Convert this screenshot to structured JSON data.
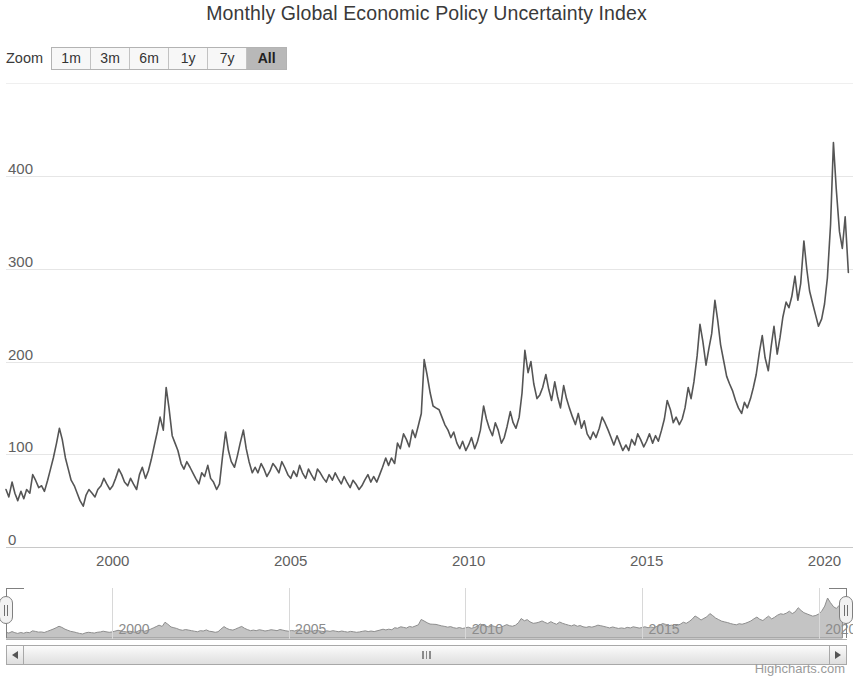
{
  "title": "Monthly Global Economic Policy Uncertainty Index",
  "range_selector": {
    "label": "Zoom",
    "buttons": [
      {
        "label": "1m",
        "selected": false
      },
      {
        "label": "3m",
        "selected": false
      },
      {
        "label": "6m",
        "selected": false
      },
      {
        "label": "1y",
        "selected": false
      },
      {
        "label": "7y",
        "selected": false
      },
      {
        "label": "All",
        "selected": true
      }
    ]
  },
  "credits": "Highcharts.com",
  "colors": {
    "line": "#555555",
    "gridline": "#e6e6e6",
    "nav_fill": "#b0b0b0",
    "nav_line": "#8e8e8e",
    "text": "#606060",
    "title": "#3a3a3a",
    "button_selected_bg": "#b8b8b8"
  },
  "scrollbar": {
    "left_arrow": "scroll-left-arrow-icon",
    "right_arrow": "scroll-right-arrow-icon"
  },
  "chart_data": {
    "type": "line",
    "title": "Monthly Global Economic Policy Uncertainty Index",
    "xlabel": "",
    "ylabel": "",
    "grid": true,
    "legend": false,
    "xlim": [
      1997.0,
      2020.8
    ],
    "ylim": [
      0,
      460
    ],
    "yticks": [
      0,
      100,
      200,
      300,
      400
    ],
    "xticks": [
      2000,
      2005,
      2010,
      2015,
      2020
    ],
    "x_tick_labels": [
      "2000",
      "2005",
      "2010",
      "2015",
      "2020"
    ],
    "y_tick_labels": [
      "0",
      "100",
      "200",
      "300",
      "400"
    ],
    "navigator": {
      "xticks": [
        2000,
        2005,
        2010,
        2015,
        2020
      ],
      "x_tick_labels": [
        "2000",
        "2005",
        "2010",
        "2015",
        "2020"
      ],
      "range_start": 1997.0,
      "range_end": 2020.8
    },
    "series": [
      {
        "name": "Global Economic Policy Uncertainty Index",
        "x": [
          1997.0,
          1997.08,
          1997.17,
          1997.25,
          1997.33,
          1997.42,
          1997.5,
          1997.58,
          1997.67,
          1997.75,
          1997.83,
          1997.92,
          1998.0,
          1998.08,
          1998.17,
          1998.25,
          1998.33,
          1998.42,
          1998.5,
          1998.58,
          1998.67,
          1998.75,
          1998.83,
          1998.92,
          1999.0,
          1999.08,
          1999.17,
          1999.25,
          1999.33,
          1999.42,
          1999.5,
          1999.58,
          1999.67,
          1999.75,
          1999.83,
          1999.92,
          2000.0,
          2000.08,
          2000.17,
          2000.25,
          2000.33,
          2000.42,
          2000.5,
          2000.58,
          2000.67,
          2000.75,
          2000.83,
          2000.92,
          2001.0,
          2001.08,
          2001.17,
          2001.25,
          2001.33,
          2001.42,
          2001.5,
          2001.58,
          2001.67,
          2001.75,
          2001.83,
          2001.92,
          2002.0,
          2002.08,
          2002.17,
          2002.25,
          2002.33,
          2002.42,
          2002.5,
          2002.58,
          2002.67,
          2002.75,
          2002.83,
          2002.92,
          2003.0,
          2003.08,
          2003.17,
          2003.25,
          2003.33,
          2003.42,
          2003.5,
          2003.58,
          2003.67,
          2003.75,
          2003.83,
          2003.92,
          2004.0,
          2004.08,
          2004.17,
          2004.25,
          2004.33,
          2004.42,
          2004.5,
          2004.58,
          2004.67,
          2004.75,
          2004.83,
          2004.92,
          2005.0,
          2005.08,
          2005.17,
          2005.25,
          2005.33,
          2005.42,
          2005.5,
          2005.58,
          2005.67,
          2005.75,
          2005.83,
          2005.92,
          2006.0,
          2006.08,
          2006.17,
          2006.25,
          2006.33,
          2006.42,
          2006.5,
          2006.58,
          2006.67,
          2006.75,
          2006.83,
          2006.92,
          2007.0,
          2007.08,
          2007.17,
          2007.25,
          2007.33,
          2007.42,
          2007.5,
          2007.58,
          2007.67,
          2007.75,
          2007.83,
          2007.92,
          2008.0,
          2008.08,
          2008.17,
          2008.25,
          2008.33,
          2008.42,
          2008.5,
          2008.58,
          2008.67,
          2008.75,
          2008.83,
          2008.92,
          2009.0,
          2009.08,
          2009.17,
          2009.25,
          2009.33,
          2009.42,
          2009.5,
          2009.58,
          2009.67,
          2009.75,
          2009.83,
          2009.92,
          2010.0,
          2010.08,
          2010.17,
          2010.25,
          2010.33,
          2010.42,
          2010.5,
          2010.58,
          2010.67,
          2010.75,
          2010.83,
          2010.92,
          2011.0,
          2011.08,
          2011.17,
          2011.25,
          2011.33,
          2011.42,
          2011.5,
          2011.58,
          2011.67,
          2011.75,
          2011.83,
          2011.92,
          2012.0,
          2012.08,
          2012.17,
          2012.25,
          2012.33,
          2012.42,
          2012.5,
          2012.58,
          2012.67,
          2012.75,
          2012.83,
          2012.92,
          2013.0,
          2013.08,
          2013.17,
          2013.25,
          2013.33,
          2013.42,
          2013.5,
          2013.58,
          2013.67,
          2013.75,
          2013.83,
          2013.92,
          2014.0,
          2014.08,
          2014.17,
          2014.25,
          2014.33,
          2014.42,
          2014.5,
          2014.58,
          2014.67,
          2014.75,
          2014.83,
          2014.92,
          2015.0,
          2015.08,
          2015.17,
          2015.25,
          2015.33,
          2015.42,
          2015.5,
          2015.58,
          2015.67,
          2015.75,
          2015.83,
          2015.92,
          2016.0,
          2016.08,
          2016.17,
          2016.25,
          2016.33,
          2016.42,
          2016.5,
          2016.58,
          2016.67,
          2016.75,
          2016.83,
          2016.92,
          2017.0,
          2017.08,
          2017.17,
          2017.25,
          2017.33,
          2017.42,
          2017.5,
          2017.58,
          2017.67,
          2017.75,
          2017.83,
          2017.92,
          2018.0,
          2018.08,
          2018.17,
          2018.25,
          2018.33,
          2018.42,
          2018.5,
          2018.58,
          2018.67,
          2018.75,
          2018.83,
          2018.92,
          2019.0,
          2019.08,
          2019.17,
          2019.25,
          2019.33,
          2019.42,
          2019.5,
          2019.58,
          2019.67,
          2019.75,
          2019.83,
          2019.92,
          2020.0,
          2020.08,
          2020.17,
          2020.25,
          2020.33,
          2020.42,
          2020.5,
          2020.58,
          2020.67
        ],
        "values": [
          62,
          54,
          70,
          58,
          50,
          60,
          52,
          62,
          58,
          78,
          72,
          64,
          66,
          60,
          72,
          84,
          96,
          112,
          128,
          116,
          96,
          84,
          72,
          66,
          58,
          50,
          44,
          56,
          62,
          58,
          54,
          62,
          66,
          74,
          68,
          62,
          66,
          74,
          84,
          78,
          70,
          66,
          74,
          68,
          62,
          78,
          86,
          74,
          82,
          94,
          110,
          124,
          140,
          126,
          172,
          150,
          120,
          112,
          104,
          90,
          84,
          92,
          86,
          80,
          74,
          68,
          80,
          76,
          88,
          74,
          70,
          62,
          68,
          96,
          124,
          104,
          92,
          86,
          98,
          112,
          126,
          106,
          92,
          80,
          86,
          80,
          90,
          84,
          76,
          82,
          90,
          86,
          80,
          92,
          86,
          78,
          74,
          82,
          76,
          88,
          80,
          74,
          84,
          78,
          72,
          84,
          80,
          74,
          70,
          78,
          72,
          80,
          74,
          68,
          76,
          70,
          64,
          72,
          68,
          62,
          66,
          72,
          78,
          70,
          76,
          70,
          78,
          86,
          96,
          88,
          96,
          90,
          112,
          106,
          122,
          116,
          108,
          126,
          118,
          130,
          144,
          202,
          186,
          166,
          152,
          150,
          148,
          140,
          132,
          126,
          118,
          124,
          112,
          106,
          114,
          104,
          110,
          118,
          106,
          114,
          126,
          152,
          138,
          128,
          120,
          134,
          126,
          112,
          118,
          130,
          146,
          134,
          128,
          140,
          166,
          212,
          188,
          200,
          176,
          160,
          164,
          172,
          186,
          170,
          158,
          178,
          162,
          150,
          174,
          160,
          150,
          140,
          132,
          144,
          128,
          136,
          122,
          116,
          124,
          118,
          128,
          140,
          134,
          126,
          118,
          110,
          120,
          112,
          104,
          110,
          104,
          116,
          110,
          122,
          116,
          108,
          114,
          122,
          112,
          120,
          114,
          126,
          138,
          158,
          148,
          134,
          140,
          132,
          138,
          150,
          172,
          160,
          178,
          206,
          240,
          222,
          196,
          214,
          230,
          266,
          244,
          218,
          200,
          184,
          176,
          168,
          158,
          150,
          144,
          156,
          150,
          160,
          172,
          186,
          210,
          228,
          204,
          190,
          216,
          238,
          208,
          226,
          248,
          264,
          258,
          270,
          292,
          266,
          284,
          330,
          300,
          276,
          262,
          250,
          238,
          246,
          262,
          290,
          348,
          436,
          386,
          340,
          322,
          356,
          296
        ]
      }
    ]
  }
}
